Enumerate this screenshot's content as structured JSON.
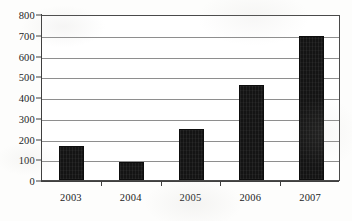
{
  "chart_data": {
    "type": "bar",
    "title": "",
    "xlabel": "",
    "ylabel": "",
    "categories": [
      "2003",
      "2004",
      "2005",
      "2006",
      "2007"
    ],
    "values": [
      165,
      85,
      245,
      460,
      695
    ],
    "ylim": [
      0,
      800
    ],
    "y_ticks": [
      "0",
      "100",
      "200",
      "300",
      "400",
      "500",
      "600",
      "700",
      "800"
    ],
    "y_tick_values": [
      0,
      100,
      200,
      300,
      400,
      500,
      600,
      700,
      800
    ],
    "grid": true,
    "legend": "none",
    "series": [
      {
        "name": "",
        "values": [
          165,
          85,
          245,
          460,
          695
        ]
      }
    ],
    "colors": {
      "bar": "#141414",
      "gridline": "#8e8e8e",
      "axis": "#3f3f3f",
      "text": "#1c1c1c",
      "plot_background": "#ffffff"
    }
  }
}
